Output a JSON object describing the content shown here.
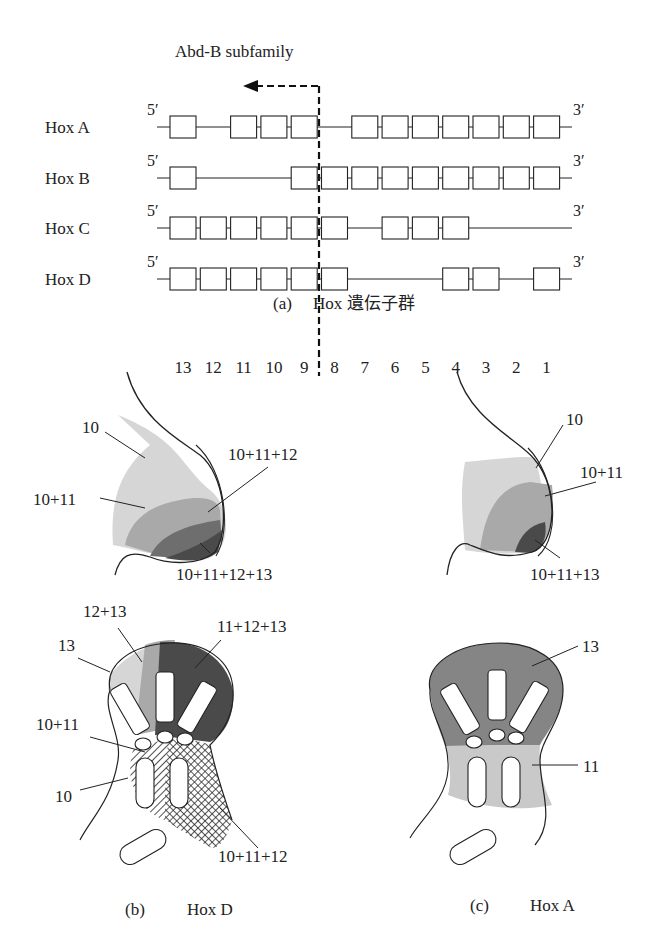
{
  "panel_a": {
    "subfamily_label": "Abd-B subfamily",
    "caption_letter": "(a)",
    "caption_text": "Hox 遺伝子群",
    "five_prime": "5′",
    "three_prime": "3′",
    "clusters": [
      {
        "name": "Hox A",
        "genes_present": [
          13,
          11,
          10,
          9,
          7,
          6,
          5,
          4,
          3,
          2,
          1
        ]
      },
      {
        "name": "Hox B",
        "genes_present": [
          13,
          9,
          8,
          7,
          6,
          5,
          4,
          3,
          2,
          1
        ]
      },
      {
        "name": "Hox C",
        "genes_present": [
          13,
          12,
          11,
          10,
          9,
          8,
          6,
          5,
          4
        ]
      },
      {
        "name": "Hox D",
        "genes_present": [
          13,
          12,
          11,
          10,
          9,
          8,
          4,
          3,
          1
        ]
      }
    ],
    "paralog_numbers": [
      "13",
      "12",
      "11",
      "10",
      "9",
      "8",
      "7",
      "6",
      "5",
      "4",
      "3",
      "2",
      "1"
    ]
  },
  "panel_b": {
    "caption_letter": "(b)",
    "caption_text": "Hox D",
    "bud_labels": {
      "l10": "10",
      "l10_11": "10+11",
      "l10_11_12": "10+11+12",
      "l10_11_12_13": "10+11+12+13"
    },
    "limb_labels": {
      "l12_13": "12+13",
      "l13": "13",
      "l11_12_13": "11+12+13",
      "l10_11": "10+11",
      "l10": "10",
      "l10_11_12": "10+11+12"
    }
  },
  "panel_c": {
    "caption_letter": "(c)",
    "caption_text": "Hox A",
    "bud_labels": {
      "l10": "10",
      "l10_11": "10+11",
      "l10_11_13": "10+11+13"
    },
    "limb_labels": {
      "l13": "13",
      "l11": "11"
    }
  },
  "colors": {
    "shade_light": "#d6d6d6",
    "shade_mid": "#a9a9a9",
    "shade_dark": "#6e6e6e",
    "shade_darkest": "#4a4a4a",
    "line": "#222222"
  }
}
